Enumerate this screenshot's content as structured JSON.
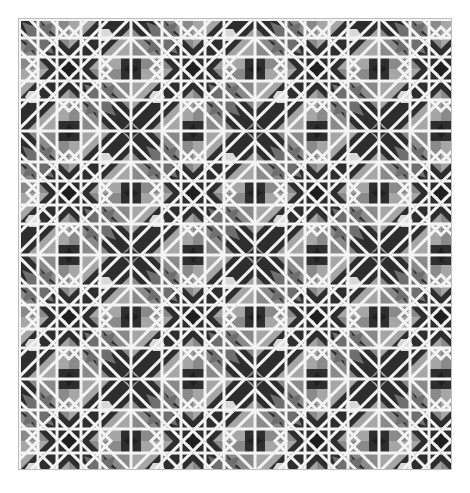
{
  "image": {
    "subject": "Islamic geometric interlace tile pattern",
    "colors": {
      "background": "#ffffff",
      "band": "#f2f2f2",
      "dark": "#2e2e2e",
      "mid": "#7e7e7e",
      "light_gray": "#a9a9a9",
      "pale": "#d8d8d8"
    },
    "tile_period_px": 62
  }
}
